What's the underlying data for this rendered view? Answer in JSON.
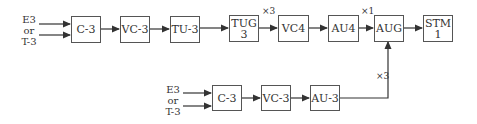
{
  "diagram": {
    "top_row": {
      "input_label": [
        "E3",
        "or",
        "T-3"
      ],
      "boxes": [
        "C-3",
        "VC-3",
        "TU-3",
        "TUG\n3",
        "VC4",
        "AU4",
        "AUG",
        "STM\n1"
      ],
      "multipliers": {
        "tug3_to_vc4": "×3",
        "au4_to_aug": "×1"
      }
    },
    "bottom_row": {
      "input_label": [
        "E3",
        "or",
        "T-3"
      ],
      "boxes": [
        "C-3",
        "VC-3",
        "AU-3"
      ],
      "multiplier": "×3"
    }
  }
}
